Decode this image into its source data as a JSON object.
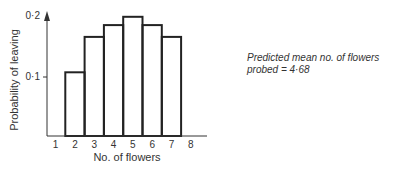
{
  "chart_data": {
    "type": "bar",
    "title": "",
    "xlabel": "No. of flowers",
    "ylabel": "Probability of leaving",
    "categories": [
      "1",
      "2",
      "3",
      "4",
      "5",
      "6",
      "7",
      "8"
    ],
    "values": [
      0,
      0.108,
      0.168,
      0.188,
      0.202,
      0.188,
      0.168,
      0
    ],
    "ylim": [
      0,
      0.2
    ],
    "yticks": [
      "0·1",
      "0·2"
    ],
    "xticks": [
      "1",
      "2",
      "3",
      "4",
      "5",
      "6",
      "7",
      "8"
    ],
    "grid": false,
    "style": "outlined histogram",
    "annotation": "Predicted mean no. of flowers probed = 4·68"
  },
  "annotation": {
    "line1": "Predicted mean no. of flowers",
    "line2": "probed = 4·68"
  }
}
